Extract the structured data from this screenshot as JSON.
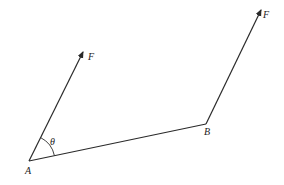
{
  "diagram": {
    "title": "",
    "colors": {
      "line": "#2a2a2a",
      "background": "#ffffff",
      "text": "#222222"
    },
    "points": {
      "A": {
        "label": "A",
        "x": 29,
        "y": 161
      },
      "B": {
        "label": "B",
        "x": 206,
        "y": 124
      }
    },
    "forces": [
      {
        "label": "F",
        "from": "A",
        "tip": {
          "x": 83,
          "y": 51
        }
      },
      {
        "label": "F",
        "from": "B",
        "tip": {
          "x": 261,
          "y": 9
        }
      }
    ],
    "angle": {
      "label": "θ",
      "vertex": "A"
    },
    "labels": {
      "force_a": "F",
      "force_b": "F",
      "point_a": "A",
      "point_b": "B",
      "theta": "θ"
    }
  }
}
